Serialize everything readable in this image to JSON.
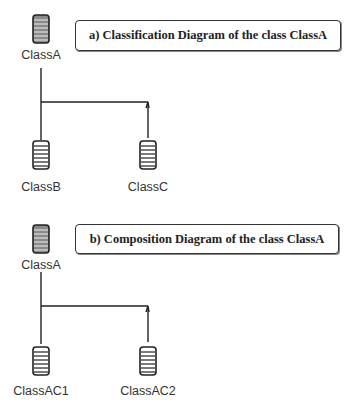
{
  "diagrams": [
    {
      "id": "a",
      "title": "a)  Classification Diagram of the class ClassA",
      "root": {
        "label": "ClassA",
        "icon": "class-icon"
      },
      "children": [
        {
          "label": "ClassB",
          "icon": "class-icon"
        },
        {
          "label": "ClassC",
          "icon": "class-icon"
        }
      ]
    },
    {
      "id": "b",
      "title": "b)  Composition Diagram of the class ClassA",
      "root": {
        "label": "ClassA",
        "icon": "class-icon"
      },
      "children": [
        {
          "label": "ClassAC1",
          "icon": "class-icon"
        },
        {
          "label": "ClassAC2",
          "icon": "class-icon"
        }
      ]
    }
  ],
  "colors": {
    "line": "#222222",
    "icon_stroke": "#222222",
    "icon_fill": "#aaaaaa",
    "root_icon_fill": "#888888"
  }
}
